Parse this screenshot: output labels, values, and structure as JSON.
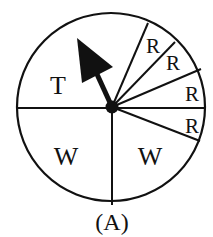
{
  "diagram": {
    "type": "spinner",
    "caption": "(A)",
    "colors": {
      "stroke": "#111111",
      "background": "#ffffff"
    },
    "circle": {
      "cx": 111,
      "cy": 107,
      "r": 94
    },
    "sectors": [
      {
        "label": "T",
        "x": 58,
        "y": 94,
        "size": 26
      },
      {
        "label": "W",
        "x": 66,
        "y": 165,
        "size": 26
      },
      {
        "label": "W",
        "x": 150,
        "y": 165,
        "size": 26
      },
      {
        "label": "R",
        "x": 153,
        "y": 53,
        "size": 21
      },
      {
        "label": "R",
        "x": 173,
        "y": 70,
        "size": 21
      },
      {
        "label": "R",
        "x": 192,
        "y": 101,
        "size": 21
      },
      {
        "label": "R",
        "x": 192,
        "y": 133,
        "size": 21
      }
    ],
    "arrow": {
      "icon": "spinner-arrow-icon",
      "points_toward": "T"
    }
  }
}
